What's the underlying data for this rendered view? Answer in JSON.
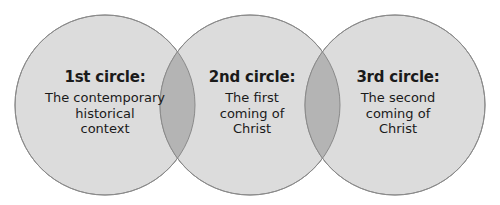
{
  "diagram": {
    "type": "three-circle-venn-chain",
    "colors": {
      "circle_fill": "#dcdcdc",
      "overlap_fill": "#b4b4b4",
      "stroke": "#8a8a8a",
      "text": "#1a1a1a",
      "background": "#ffffff"
    },
    "circles": [
      {
        "title": "1st circle:",
        "description": "The contemporary\nhistorical\ncontext"
      },
      {
        "title": "2nd circle:",
        "description": "The first\ncoming of\nChrist"
      },
      {
        "title": "3rd circle:",
        "description": "The second\ncoming of\nChrist"
      }
    ]
  }
}
